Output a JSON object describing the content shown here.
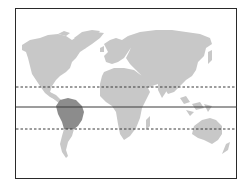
{
  "map": {
    "type": "world-map",
    "projection": "equirectangular-like",
    "colors": {
      "background": "#ffffff",
      "frame": "#2a2a2a",
      "land": "#c8c8c8",
      "highlight_land": "#8c8c8c",
      "south_america_lower": "#c8c8c8",
      "lines": "#3a3a3a"
    },
    "lines": [
      {
        "name": "tropic-of-cancer",
        "style": "dashed",
        "y": 87
      },
      {
        "name": "equator",
        "style": "solid",
        "y": 107
      },
      {
        "name": "tropic-of-capricorn",
        "style": "dashed",
        "y": 129
      }
    ],
    "highlighted_region": "South America (tropical region)",
    "frame": {
      "x": 15,
      "y": 8,
      "width": 222,
      "height": 171
    }
  }
}
